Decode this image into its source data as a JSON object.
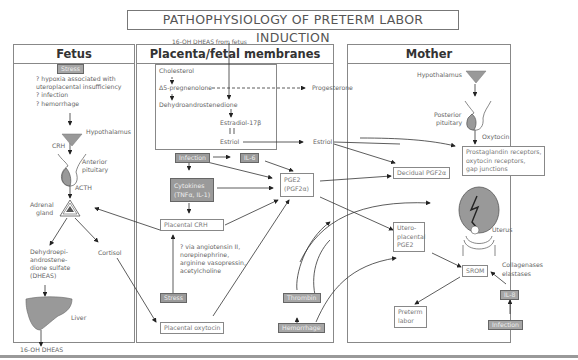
{
  "title": "PATHOPHYSIOLOGY OF PRETERM LABOR INDUCTION",
  "top_label": "16-OH DHEAS from fetus",
  "panels": {
    "fetus": {
      "heading": "Fetus",
      "stress": "Stress",
      "causes": [
        "? hypoxia associated with",
        "uteroplacental insufficiency",
        "? infection",
        "? hemorrhage"
      ],
      "hypothalamus": "Hypothalamus",
      "crh": "CRH",
      "anterior_pituitary": [
        "Anterior",
        "pituitary"
      ],
      "acth": "ACTH",
      "adrenal_gland": [
        "Adrenal",
        "gland"
      ],
      "dheas": [
        "Dehydroepi-",
        "androstene-",
        "dione sulfate",
        "(DHEAS)"
      ],
      "cortisol": "Cortisol",
      "liver": "Liver",
      "output": "16-OH DHEAS"
    },
    "placenta": {
      "heading": "Placenta/fetal membranes",
      "steroid_path": {
        "cholesterol": "Cholesterol",
        "pregnenolone": "Δ5-pregnenolone",
        "progesterone": "Progesterone",
        "dehydroandrostenedione": "Dehydroandrostenedione",
        "estradiol": "Estradiol-17β",
        "estriol": "Estriol",
        "estriol_out": "Estriol"
      },
      "infection": "Infection",
      "il6": "IL-6",
      "cytokines": [
        "Cytokines",
        "(TNFα, IL-1)"
      ],
      "pge2": [
        "PGE2",
        "(PGF2α)"
      ],
      "placental_crh": "Placental CRH",
      "via_list": [
        "? via angiotensin II,",
        "norepinephrine,",
        "arginine vasopressin,",
        "acetylcholine"
      ],
      "stress": "Stress",
      "placental_oxytocin": "Placental oxytocin",
      "thrombin": "Thrombin",
      "hemorrhage": "Hemorrhage"
    },
    "mother": {
      "heading": "Mother",
      "hypothalamus": "Hypothalamus",
      "posterior_pituitary": [
        "Posterior",
        "pituitary"
      ],
      "oxytocin": "Oxytocin",
      "receptors": [
        "Prostaglandin receptors,",
        "oxytocin receptors,",
        "gap junctions"
      ],
      "decidual_pgf": "Decidual PGF2α",
      "uterus": "Uterus",
      "uteroplacental_pge": [
        "Utero-",
        "placental",
        "PGE2"
      ],
      "srom": "SROM",
      "collagenases": [
        "Collagenases",
        "elastases"
      ],
      "il8": "IL-8",
      "preterm_labor": [
        "Preterm",
        "labor"
      ],
      "infection": "Infection"
    }
  }
}
